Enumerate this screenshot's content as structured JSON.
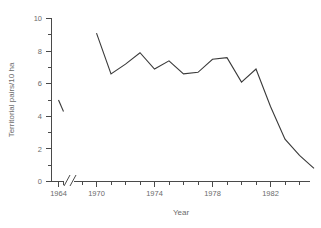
{
  "chart_data": {
    "type": "line",
    "title": "",
    "xlabel": "Year",
    "ylabel": "Territorial pairs/10 ha",
    "xlim": [
      1963.2,
      1984.6
    ],
    "ylim": [
      0,
      10
    ],
    "grid": false,
    "legend": null,
    "axis_break": {
      "present": true,
      "between": [
        1965,
        1968
      ],
      "axis": "x"
    },
    "x_major_ticks": [
      1964,
      1970,
      1974,
      1978,
      1982
    ],
    "x_major_tick_labels": [
      "1964",
      "1970",
      "1974",
      "1978",
      "1982"
    ],
    "x_minor_ticks": [
      1965,
      1968,
      1969,
      1971,
      1972,
      1973,
      1975,
      1976,
      1977,
      1979,
      1980,
      1981,
      1983,
      1984
    ],
    "y_major_ticks": [
      0,
      2,
      4,
      6,
      8,
      10
    ],
    "y_major_tick_labels": [
      "0",
      "2",
      "4",
      "6",
      "8",
      "10"
    ],
    "y_minor_ticks": [
      1,
      3,
      5,
      7,
      9
    ],
    "series": [
      {
        "name": "segment-early",
        "x": [
          1964,
          1965
        ],
        "values": [
          5.0,
          4.3
        ]
      },
      {
        "name": "segment-main",
        "x": [
          1969,
          1970,
          1971,
          1972,
          1973,
          1974,
          1975,
          1976,
          1977,
          1978,
          1979,
          1980,
          1981,
          1982,
          1983,
          1984
        ],
        "values": [
          9.1,
          6.6,
          7.2,
          7.9,
          6.9,
          7.4,
          6.6,
          6.7,
          7.5,
          7.6,
          6.1,
          6.9,
          4.6,
          2.6,
          1.6,
          0.8
        ]
      }
    ]
  }
}
